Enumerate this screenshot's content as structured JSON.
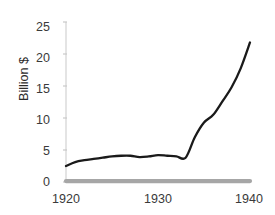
{
  "chart_data": {
    "type": "line",
    "title": "",
    "subtitle": "",
    "xlabel": "",
    "ylabel": "Billion $",
    "xlim": [
      1920,
      1940
    ],
    "ylim": [
      0,
      25
    ],
    "grid": false,
    "legend": "none",
    "xticks": [
      1920,
      1930,
      1940
    ],
    "xtick_labels": [
      "1920",
      "1930",
      "1940"
    ],
    "yticks": [
      0,
      5,
      10,
      15,
      20,
      25
    ],
    "ytick_labels": [
      "0",
      "5",
      "10",
      "15",
      "20",
      "25"
    ],
    "x": [
      1920,
      1921,
      1922,
      1923,
      1924,
      1925,
      1926,
      1927,
      1928,
      1929,
      1930,
      1931,
      1932,
      1933,
      1934,
      1935,
      1936,
      1937,
      1938,
      1939,
      1940
    ],
    "series": [
      {
        "name": "series-black",
        "color": "#1a1a1a",
        "values": [
          2.5,
          3.1,
          3.4,
          3.6,
          3.8,
          4.0,
          4.1,
          4.1,
          3.9,
          4.0,
          4.2,
          4.1,
          4.0,
          3.8,
          7.0,
          9.3,
          10.5,
          12.6,
          14.8,
          17.8,
          21.8
        ]
      },
      {
        "name": "series-gray",
        "color": "#a6a6a6",
        "values": [
          0.15,
          0.15,
          0.15,
          0.15,
          0.15,
          0.15,
          0.15,
          0.15,
          0.15,
          0.15,
          0.15,
          0.15,
          0.15,
          0.15,
          0.15,
          0.15,
          0.15,
          0.15,
          0.15,
          0.15,
          0.15
        ]
      }
    ],
    "axis_color": "#d9d9d9",
    "tick_color": "#c9c9c9",
    "text_color": "#3a3a3a"
  }
}
